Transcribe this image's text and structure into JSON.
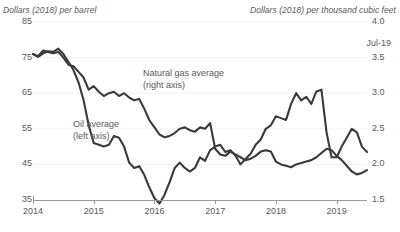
{
  "axes": {
    "left_title": "Dollars (2018) per barrel",
    "right_title": "Dollars (2018) per thousand cubic feet",
    "left_ticks": [
      "85",
      "75",
      "65",
      "55",
      "45",
      "35"
    ],
    "right_ticks": [
      "4.0",
      "3.5",
      "3.0",
      "2.5",
      "2.0",
      "1.5"
    ],
    "x_ticks": [
      "2014",
      "2015",
      "2016",
      "2017",
      "2018",
      "2019"
    ]
  },
  "annotations": {
    "last_point": "Jul-19",
    "gas_label_line1": "Natural gas average",
    "gas_label_line2": "(right axis)",
    "oil_label_line1": "Oil average",
    "oil_label_line2": "(left axis)"
  },
  "colors": {
    "line": "#3a3a3a",
    "grid": "#f2f2f2",
    "axis": "#9a9a9a",
    "text": "#58585a"
  },
  "chart_data": {
    "type": "line",
    "title": "",
    "xlabel": "",
    "ylabel": "Dollars (2018) per barrel",
    "y2label": "Dollars (2018) per thousand cubic feet",
    "ylim": [
      35,
      85
    ],
    "y2lim": [
      1.5,
      4.0
    ],
    "yticks": [
      35,
      45,
      55,
      65,
      75,
      85
    ],
    "y2ticks": [
      1.5,
      2.0,
      2.5,
      3.0,
      3.5,
      4.0
    ],
    "xlim": [
      "2014-01",
      "2019-07"
    ],
    "xticks": [
      "2014",
      "2015",
      "2016",
      "2017",
      "2018",
      "2019"
    ],
    "grid": true,
    "legend": "inline-annotations",
    "x": [
      "2014-01",
      "2014-02",
      "2014-03",
      "2014-04",
      "2014-05",
      "2014-06",
      "2014-07",
      "2014-08",
      "2014-09",
      "2014-10",
      "2014-11",
      "2014-12",
      "2015-01",
      "2015-02",
      "2015-03",
      "2015-04",
      "2015-05",
      "2015-06",
      "2015-07",
      "2015-08",
      "2015-09",
      "2015-10",
      "2015-11",
      "2015-12",
      "2016-01",
      "2016-02",
      "2016-03",
      "2016-04",
      "2016-05",
      "2016-06",
      "2016-07",
      "2016-08",
      "2016-09",
      "2016-10",
      "2016-11",
      "2016-12",
      "2017-01",
      "2017-02",
      "2017-03",
      "2017-04",
      "2017-05",
      "2017-06",
      "2017-07",
      "2017-08",
      "2017-09",
      "2017-10",
      "2017-11",
      "2017-12",
      "2018-01",
      "2018-02",
      "2018-03",
      "2018-04",
      "2018-05",
      "2018-06",
      "2018-07",
      "2018-08",
      "2018-09",
      "2018-10",
      "2018-11",
      "2018-12",
      "2019-01",
      "2019-02",
      "2019-03",
      "2019-04",
      "2019-05",
      "2019-06",
      "2019-07"
    ],
    "series": [
      {
        "name": "Oil average",
        "axis": "left",
        "unit": "Dollars (2018) per barrel",
        "values": [
          76.0,
          75.2,
          76.2,
          76.8,
          76.6,
          77.5,
          76.0,
          73.8,
          71.5,
          68.0,
          63.0,
          56.0,
          51.0,
          50.5,
          50.0,
          50.5,
          53.0,
          52.5,
          50.0,
          45.5,
          44.0,
          44.5,
          42.0,
          38.5,
          35.5,
          34.0,
          36.5,
          40.0,
          44.0,
          45.5,
          44.0,
          43.0,
          44.0,
          47.0,
          46.0,
          49.0,
          50.0,
          50.5,
          48.5,
          49.0,
          47.5,
          45.0,
          46.5,
          48.0,
          50.5,
          52.0,
          55.0,
          56.0,
          58.5,
          58.0,
          57.5,
          62.0,
          65.0,
          63.0,
          64.0,
          62.0,
          65.5,
          66.0,
          54.0,
          47.0,
          47.0,
          50.0,
          52.5,
          55.0,
          54.0,
          50.0,
          48.5
        ]
      },
      {
        "name": "Natural gas average",
        "axis": "right",
        "unit": "Dollars (2018) per thousand cubic feet",
        "values": [
          3.55,
          3.52,
          3.6,
          3.58,
          3.56,
          3.58,
          3.5,
          3.4,
          3.38,
          3.3,
          3.22,
          3.05,
          3.1,
          3.02,
          2.96,
          3.0,
          3.02,
          2.96,
          3.0,
          2.94,
          2.9,
          2.92,
          2.78,
          2.62,
          2.52,
          2.42,
          2.38,
          2.4,
          2.44,
          2.5,
          2.52,
          2.48,
          2.46,
          2.52,
          2.5,
          2.58,
          2.22,
          2.14,
          2.12,
          2.18,
          2.14,
          2.1,
          2.06,
          2.08,
          2.12,
          2.18,
          2.2,
          2.18,
          2.04,
          2.0,
          1.98,
          1.96,
          2.0,
          2.02,
          2.04,
          2.06,
          2.1,
          2.16,
          2.22,
          2.2,
          2.12,
          2.06,
          1.98,
          1.9,
          1.86,
          1.88,
          1.92
        ]
      }
    ]
  }
}
